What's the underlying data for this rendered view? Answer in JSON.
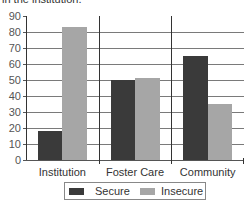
{
  "caption": "in the institution.",
  "colors": {
    "secure": "#3a3a3a",
    "insecure": "#a6a6a6",
    "grid": "#7a7a7a"
  },
  "legend": {
    "secure_label": "Secure",
    "insecure_label": "Insecure"
  },
  "chart_data": {
    "type": "bar",
    "title": "",
    "xlabel": "",
    "ylabel": "",
    "categories": [
      "Institution",
      "Foster Care",
      "Community"
    ],
    "series": [
      {
        "name": "Secure",
        "values": [
          18,
          50,
          65
        ]
      },
      {
        "name": "Insecure",
        "values": [
          83,
          51,
          35
        ]
      }
    ],
    "ylim": [
      0,
      90
    ],
    "yticks": [
      0,
      10,
      20,
      30,
      40,
      50,
      60,
      70,
      80,
      90
    ],
    "grid": true,
    "legend_position": "bottom"
  }
}
